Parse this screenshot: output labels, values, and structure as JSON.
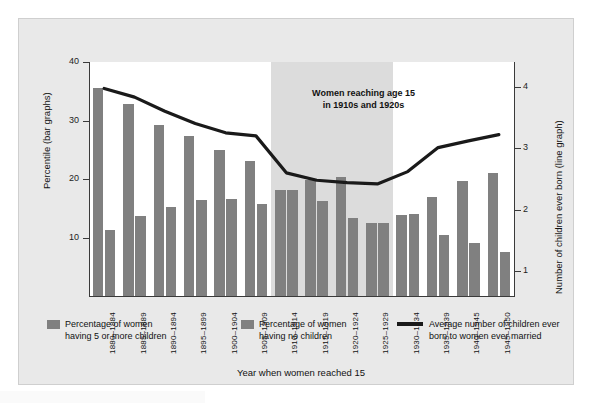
{
  "chart_data": {
    "type": "bar",
    "title": "",
    "xlabel": "Year when women reached 15",
    "ylabel": "Percentile (bar graphs)",
    "y2label": "Number of children ever born (line graph)",
    "grid": false,
    "legend_position": "bottom",
    "ylim": [
      0,
      40
    ],
    "y2lim": [
      0.6,
      4.4
    ],
    "yticks": [
      10,
      20,
      30,
      40
    ],
    "y2ticks": [
      1,
      2,
      3,
      4
    ],
    "categories": [
      "1880–1884",
      "1885–1889",
      "1890–1894",
      "1895–1899",
      "1900–1904",
      "1905–1909",
      "1910–1914",
      "1915–1919",
      "1920–1924",
      "1925–1929",
      "1930–1934",
      "1935–1939",
      "1940–1945",
      "1945–1950"
    ],
    "series": [
      {
        "name": "Percentage of women having 5 or more children",
        "axis": "left",
        "type": "bar",
        "color": "#808080",
        "values": [
          35.5,
          32.8,
          29.3,
          27.3,
          25.0,
          23.0,
          18.2,
          19.9,
          20.3,
          12.5,
          13.9,
          17.0,
          19.6,
          21.0
        ]
      },
      {
        "name": "Percentage of women having no children",
        "axis": "left",
        "type": "bar",
        "color": "#808080",
        "values": [
          11.3,
          13.7,
          15.2,
          16.4,
          16.5,
          15.7,
          18.2,
          16.3,
          13.4,
          12.5,
          14.0,
          10.4,
          9.0,
          7.5
        ]
      },
      {
        "name": "Average number of children ever born to women ever married",
        "axis": "right",
        "type": "line",
        "color": "#1a1a1a",
        "values": [
          3.97,
          3.83,
          3.6,
          3.4,
          3.25,
          3.2,
          2.6,
          2.48,
          2.44,
          2.42,
          2.62,
          3.01,
          3.12,
          3.22
        ]
      }
    ],
    "annotations": [
      {
        "name": "highlight-band",
        "text": "Women reaching age 15\nin 1910s and 1920s",
        "text_line1": "Women reaching age 15",
        "text_line2": "in 1910s and 1920s",
        "span_categories": [
          "1910–1914",
          "1925–1929"
        ]
      }
    ]
  },
  "axes": {
    "left": {
      "label": "Percentile (bar graphs)",
      "ticks": [
        "10",
        "20",
        "30",
        "40"
      ]
    },
    "right": {
      "label": "Number of children ever born (line graph)",
      "ticks": [
        "1",
        "2",
        "3",
        "4"
      ]
    },
    "bottom": {
      "label": "Year when women reached 15",
      "ticks": [
        "1880–1884",
        "1885–1889",
        "1890–1894",
        "1895–1899",
        "1900–1904",
        "1905–1909",
        "1910–1914",
        "1915–1919",
        "1920–1924",
        "1925–1929",
        "1930–1934",
        "1935–1939",
        "1940–1945",
        "1945–1950"
      ]
    }
  },
  "annotation": {
    "line1": "Women reaching age 15",
    "line2": "in 1910s and 1920s"
  },
  "legend": {
    "items": [
      {
        "marker": "swatch",
        "line1": "Percentage of women",
        "line2": "having 5 or more children"
      },
      {
        "marker": "swatch",
        "line1": "Percentage of women",
        "line2": "having no children"
      },
      {
        "marker": "line",
        "line1": "Average number of children ever",
        "line2": "born to women ever married"
      }
    ]
  },
  "colors": {
    "bar": "#808080",
    "line": "#1a1a1a",
    "card_bg": "#e9e9e9",
    "plot_bg": "#ffffff",
    "band_bg": "#dcdcdc",
    "axis": "#3a3a3a"
  }
}
